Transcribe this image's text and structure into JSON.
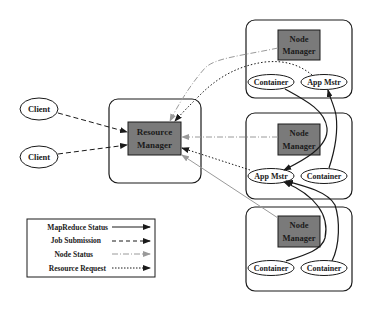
{
  "diagram": {
    "type": "architecture",
    "clients": [
      {
        "label": "Client"
      },
      {
        "label": "Client"
      }
    ],
    "resource_manager": {
      "label_line1": "Resource",
      "label_line2": "Manager"
    },
    "nodes": [
      {
        "node_manager": {
          "label_line1": "Node",
          "label_line2": "Manager"
        },
        "ellipses": [
          {
            "label": "Container"
          },
          {
            "label": "App Mstr"
          }
        ]
      },
      {
        "node_manager": {
          "label_line1": "Node",
          "label_line2": "Manager"
        },
        "ellipses": [
          {
            "label": "App Mstr"
          },
          {
            "label": "Container"
          }
        ]
      },
      {
        "node_manager": {
          "label_line1": "Node",
          "label_line2": "Manager"
        },
        "ellipses": [
          {
            "label": "Container"
          },
          {
            "label": "Container"
          }
        ]
      }
    ],
    "legend": {
      "items": [
        {
          "label": "MapReduce Status",
          "style": "solid"
        },
        {
          "label": "Job Submission",
          "style": "dashed"
        },
        {
          "label": "Node Status",
          "style": "dash-dot"
        },
        {
          "label": "Resource Request",
          "style": "dotted"
        }
      ]
    },
    "colors": {
      "box_fill": "#7a7a7a",
      "stroke": "#1a1a1a",
      "node_status": "#9a9a9a"
    },
    "edges": [
      {
        "from": "Client 1",
        "to": "Resource Manager",
        "type": "Job Submission"
      },
      {
        "from": "Client 2",
        "to": "Resource Manager",
        "type": "Job Submission"
      },
      {
        "from": "Node Manager 1",
        "to": "Resource Manager",
        "type": "Node Status"
      },
      {
        "from": "Node Manager 2",
        "to": "Resource Manager",
        "type": "Node Status"
      },
      {
        "from": "Node Manager 3",
        "to": "Resource Manager",
        "type": "Node Status"
      },
      {
        "from": "App Mstr (node 1)",
        "to": "Resource Manager",
        "type": "Resource Request"
      },
      {
        "from": "App Mstr (node 2)",
        "to": "Resource Manager",
        "type": "Resource Request"
      },
      {
        "from": "Container (node 1)",
        "to": "App Mstr (node 2)",
        "type": "MapReduce Status"
      },
      {
        "from": "Container (node 2)",
        "to": "App Mstr (node 1)",
        "type": "MapReduce Status"
      },
      {
        "from": "Container (node 3, left)",
        "to": "App Mstr (node 2)",
        "type": "MapReduce Status"
      },
      {
        "from": "Container (node 3, right)",
        "to": "App Mstr (node 2)",
        "type": "MapReduce Status"
      }
    ]
  }
}
